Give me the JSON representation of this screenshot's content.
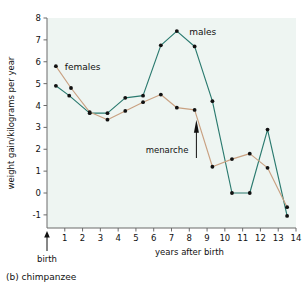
{
  "figure": {
    "caption": "(b) chimpanzee",
    "caption_prefix": "(b)",
    "caption_subject": "chimpanzee"
  },
  "axes": {
    "y_title": "weight gain/kilograms per year",
    "x_title": "years after birth",
    "y_ticks": [
      "8",
      "7",
      "6",
      "5",
      "4",
      "3",
      "2",
      "1",
      "0",
      "-1"
    ],
    "x_ticks": [
      "1",
      "2",
      "3",
      "4",
      "5",
      "6",
      "7",
      "8",
      "9",
      "10",
      "11",
      "12",
      "13",
      "14"
    ]
  },
  "annotations": {
    "birth": {
      "label": "birth",
      "x": 0
    },
    "menarche": {
      "label": "menarche",
      "x": 8.4,
      "y": 3.0
    },
    "males_label": "males",
    "females_label": "females"
  },
  "colors": {
    "males": "#2a7a6f",
    "females": "#c9a182",
    "marker": "#111111",
    "plot_background": "#eef5f2",
    "axis": "#6b6b6b"
  },
  "chart_data": {
    "type": "line",
    "title": "(b) chimpanzee",
    "xlabel": "years after birth",
    "ylabel": "weight gain/kilograms per year",
    "xlim": [
      0,
      14
    ],
    "ylim": [
      -1.6,
      8
    ],
    "grid": false,
    "legend": "inline-labels",
    "x": [
      0.5,
      1.5,
      2.5,
      3.5,
      4.5,
      5.5,
      6.5,
      7.5,
      8.5,
      9.5,
      10.5,
      11.5,
      12.5,
      13.5
    ],
    "series": [
      {
        "name": "males",
        "color": "#2a7a6f",
        "x": [
          0.5,
          1.25,
          2.4,
          3.4,
          4.4,
          5.4,
          6.4,
          7.3,
          8.3,
          9.3,
          10.4,
          11.4,
          12.4,
          13.5
        ],
        "values": [
          4.9,
          4.45,
          3.65,
          3.65,
          4.35,
          4.45,
          6.75,
          7.4,
          6.7,
          4.2,
          0.0,
          0.0,
          2.9,
          -1.05
        ]
      },
      {
        "name": "females",
        "color": "#c9a182",
        "x": [
          0.5,
          1.35,
          2.4,
          3.4,
          4.4,
          5.4,
          6.4,
          7.3,
          8.3,
          9.3,
          10.4,
          11.4,
          12.4,
          13.5
        ],
        "values": [
          5.8,
          4.8,
          3.7,
          3.35,
          3.75,
          4.15,
          4.5,
          3.9,
          3.8,
          1.2,
          1.55,
          1.8,
          1.15,
          -0.65
        ]
      }
    ]
  }
}
